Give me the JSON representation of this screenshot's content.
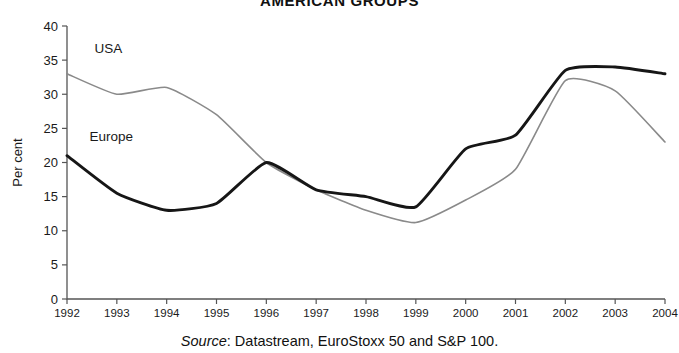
{
  "chart_data": {
    "type": "line",
    "title": "AMERICAN GROUPS",
    "subtitle": "",
    "xlabel": "",
    "ylabel": "Per cent",
    "xlim": [
      1992,
      2004
    ],
    "ylim": [
      0,
      40
    ],
    "ytick_step": 5,
    "grid": false,
    "legend_position": "inline-labels",
    "categories": [
      1992,
      1993,
      1994,
      1995,
      1996,
      1997,
      1998,
      1999,
      2000,
      2001,
      2002,
      2003,
      2004
    ],
    "yticks": [
      "0",
      "5",
      "10",
      "15",
      "20",
      "25",
      "30",
      "35",
      "40"
    ],
    "xticks": [
      "1992",
      "1993",
      "1994",
      "1995",
      "1996",
      "1997",
      "1998",
      "1999",
      "2000",
      "2001",
      "2002",
      "2003",
      "2004"
    ],
    "series": [
      {
        "name": "USA",
        "color": "#8a8a8a",
        "width": 1.6,
        "label_x": 1992.55,
        "label_y": 36.0,
        "values": [
          33.0,
          30.0,
          31.0,
          27.0,
          20.0,
          16.0,
          13.0,
          11.2,
          14.5,
          19.0,
          32.0,
          30.5,
          23.0
        ]
      },
      {
        "name": "Europe",
        "color": "#161616",
        "width": 2.9,
        "label_x": 1992.45,
        "label_y": 23.2,
        "values": [
          21.0,
          15.5,
          13.0,
          14.0,
          20.0,
          16.0,
          15.0,
          13.5,
          22.0,
          24.0,
          33.5,
          34.0,
          33.0
        ]
      }
    ],
    "annotations": {
      "europe_min_1994": 13.0,
      "europe_peak_1996": 20.0,
      "usa_min_1999": 11.2,
      "europe_peak_2003": 34.0,
      "usa_peak_2002": 32.0
    }
  },
  "source": {
    "prefix": "Source",
    "text": ": Datastream, EuroStoxx 50 and S&P 100."
  }
}
